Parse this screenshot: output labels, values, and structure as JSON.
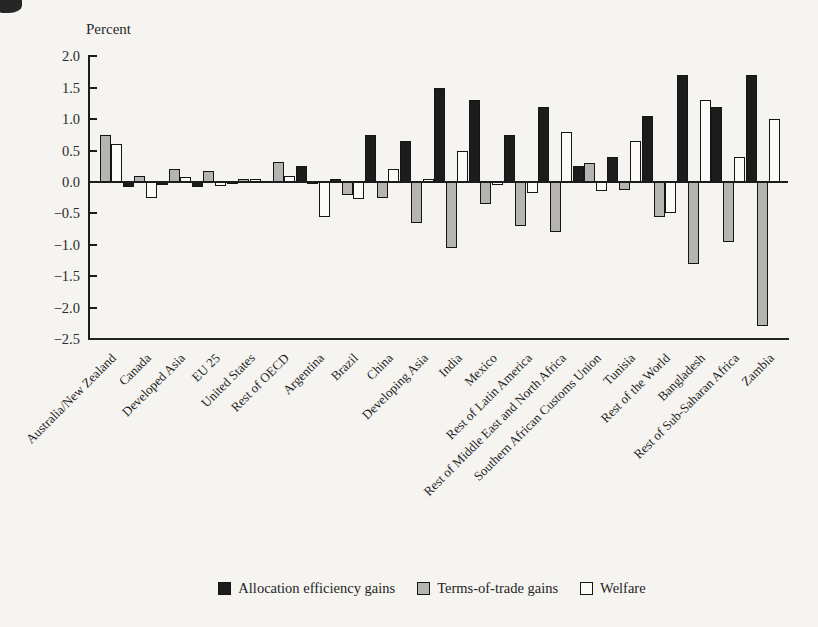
{
  "colors": {
    "allocation_fill": "#1c1c1c",
    "terms_of_trade_fill": "#b5b4b2",
    "welfare_fill": "#fcfbf8",
    "bar_outline": "#151515",
    "background": "#f5f4f1"
  },
  "chart_data": {
    "type": "bar",
    "unit_label": "Percent",
    "title": "",
    "xlabel": "",
    "ylabel": "Percent",
    "ylim": [
      -2.5,
      2.0
    ],
    "ytick_step": 0.5,
    "grid": false,
    "legend_position": "bottom",
    "yticks": [
      "2.0",
      "1.5",
      "1.0",
      "0.5",
      "0.0",
      "−0.5",
      "−1.0",
      "−1.5",
      "−2.0",
      "−2.5"
    ],
    "ytick_values": [
      2.0,
      1.5,
      1.0,
      0.5,
      0.0,
      -0.5,
      -1.0,
      -1.5,
      -2.0,
      -2.5
    ],
    "categories": [
      "Australia/New Zealand",
      "Canada",
      "Developed Asia",
      "EU 25",
      "United States",
      "Rest of OECD",
      "Argentina",
      "Brazil",
      "China",
      "Developing Asia",
      "India",
      "Mexico",
      "Rest of Latin America",
      "Rest of Middle East and North Africa",
      "Southern African Customs Union",
      "Tunisia",
      "Rest of the World",
      "Bangladesh",
      "Rest of Sub-Saharan Africa",
      "Zambia"
    ],
    "series": [
      {
        "name": "Allocation efficiency gains",
        "color": "#1c1c1c",
        "values": [
          0.02,
          -0.08,
          -0.05,
          -0.08,
          -0.03,
          0.02,
          0.25,
          0.05,
          0.75,
          0.65,
          1.5,
          1.3,
          0.75,
          1.2,
          0.25,
          0.4,
          1.05,
          1.7,
          1.2,
          1.7
        ]
      },
      {
        "name": "Terms-of-trade gains",
        "color": "#b5b4b2",
        "values": [
          0.75,
          0.1,
          0.2,
          0.18,
          0.05,
          0.32,
          -0.03,
          -0.2,
          -0.25,
          -0.65,
          -1.05,
          -0.35,
          -0.7,
          -0.8,
          0.3,
          -0.12,
          -0.55,
          -1.3,
          -0.95,
          -2.3
        ]
      },
      {
        "name": "Welfare",
        "color": "#fcfbf8",
        "values": [
          0.6,
          -0.25,
          0.08,
          -0.07,
          0.05,
          0.1,
          -0.55,
          -0.27,
          0.2,
          0.05,
          0.5,
          -0.05,
          -0.17,
          0.8,
          -0.15,
          0.65,
          -0.5,
          1.3,
          0.4,
          1.0
        ]
      }
    ]
  }
}
